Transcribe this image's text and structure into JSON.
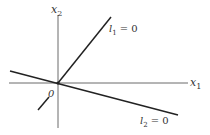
{
  "diagram": {
    "title": "",
    "colors": {
      "axis": "#6a6a6a",
      "line": "#222222",
      "text": "#333333",
      "background": "#ffffff"
    },
    "axes": {
      "x1": {
        "var": "x",
        "sub": "1",
        "label": "x1"
      },
      "x2": {
        "var": "x",
        "sub": "2",
        "label": "x2"
      },
      "origin_label": "0"
    },
    "lines": [
      {
        "name": "l1",
        "var": "l",
        "sub": "1",
        "eq": "= 0",
        "label": "l1 = 0"
      },
      {
        "name": "l2",
        "var": "l",
        "sub": "2",
        "eq": "= 0",
        "label": "l2 = 0"
      }
    ]
  }
}
